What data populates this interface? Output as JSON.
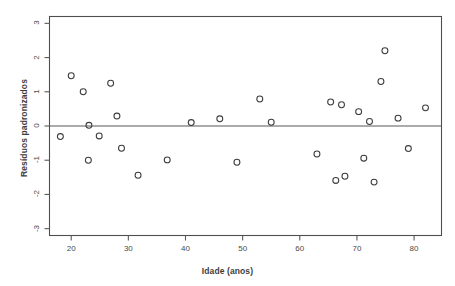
{
  "chart_data": {
    "type": "scatter",
    "title": "",
    "xlabel": "Idade (anos)",
    "ylabel": "Resíduos padronizados",
    "xlim": [
      16.2,
      84.8
    ],
    "ylim": [
      -3.2,
      3.2
    ],
    "xticks": [
      20,
      30,
      40,
      50,
      60,
      70,
      80
    ],
    "xtick_labels": [
      "20",
      "30",
      "40",
      "50",
      "60",
      "70",
      "80"
    ],
    "yticks": [
      -3,
      -2,
      -1,
      0,
      1,
      2,
      3
    ],
    "ytick_labels": [
      "-3",
      "-2",
      "-1",
      "0",
      "1",
      "2",
      "3"
    ],
    "grid": false,
    "legend": null,
    "reference_lines": [
      {
        "orientation": "horizontal",
        "y": 0,
        "color": "#595959"
      }
    ],
    "marker": {
      "shape": "circle-open",
      "size": 4,
      "color": "#3d3d3d"
    },
    "x": [
      18.1,
      20.0,
      22.1,
      23.1,
      24.9,
      26.9,
      28.0,
      28.8,
      31.7,
      36.8,
      41.0,
      46.0,
      49.0,
      53.0,
      55.0,
      63.0,
      65.4,
      66.3,
      67.3,
      67.9,
      70.3,
      71.2,
      72.2,
      73.0,
      74.2,
      74.9,
      77.2,
      79.0,
      82.0,
      23.0
    ],
    "y": [
      -0.31,
      1.47,
      1.0,
      0.02,
      -0.29,
      1.25,
      0.29,
      -0.65,
      -1.44,
      -0.99,
      0.1,
      0.21,
      -1.06,
      0.79,
      0.11,
      -0.82,
      0.7,
      -1.59,
      0.62,
      -1.47,
      0.42,
      -0.94,
      0.13,
      -1.64,
      1.3,
      2.2,
      0.23,
      -0.66,
      0.53,
      -1.0
    ],
    "points": [
      {
        "x": 18.1,
        "y": -0.31
      },
      {
        "x": 20.0,
        "y": 1.47
      },
      {
        "x": 22.1,
        "y": 1.0
      },
      {
        "x": 23.1,
        "y": 0.02
      },
      {
        "x": 23.0,
        "y": -1.0
      },
      {
        "x": 24.9,
        "y": -0.29
      },
      {
        "x": 26.9,
        "y": 1.25
      },
      {
        "x": 28.0,
        "y": 0.29
      },
      {
        "x": 28.8,
        "y": -0.65
      },
      {
        "x": 31.7,
        "y": -1.44
      },
      {
        "x": 36.8,
        "y": -0.99
      },
      {
        "x": 41.0,
        "y": 0.1
      },
      {
        "x": 46.0,
        "y": 0.21
      },
      {
        "x": 49.0,
        "y": -1.06
      },
      {
        "x": 53.0,
        "y": 0.79
      },
      {
        "x": 55.0,
        "y": 0.11
      },
      {
        "x": 63.0,
        "y": -0.82
      },
      {
        "x": 65.4,
        "y": 0.7
      },
      {
        "x": 66.3,
        "y": -1.59
      },
      {
        "x": 67.3,
        "y": 0.62
      },
      {
        "x": 67.9,
        "y": -1.47
      },
      {
        "x": 70.3,
        "y": 0.42
      },
      {
        "x": 71.2,
        "y": -0.94
      },
      {
        "x": 72.2,
        "y": 0.13
      },
      {
        "x": 73.0,
        "y": -1.64
      },
      {
        "x": 74.2,
        "y": 1.3
      },
      {
        "x": 74.9,
        "y": 2.2
      },
      {
        "x": 77.2,
        "y": 0.23
      },
      {
        "x": 79.0,
        "y": -0.66
      },
      {
        "x": 82.0,
        "y": 0.53
      }
    ]
  },
  "colors": {
    "frame": "#4f4f4f",
    "axis_line": "#5a5a5a",
    "marker": "#3d3d3d",
    "text": "#4a4a4a",
    "background": "#ffffff"
  }
}
